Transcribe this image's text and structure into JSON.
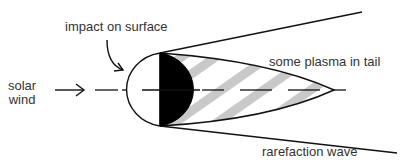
{
  "diagram": {
    "labels": {
      "impact": "impact on surface",
      "solar_wind": "solar\nwind",
      "plasma_tail": "some plasma in tail",
      "rarefaction": "rarefaction wave"
    },
    "colors": {
      "line": "#111111",
      "shadow_fill": "#000000",
      "stripe": "#c9c9c9",
      "text": "#333333",
      "background": "#ffffff"
    },
    "elements": [
      "solar wind arrow",
      "body (dayside white, nightside black)",
      "impact arrow",
      "plasma tail with gray stripes",
      "rarefaction wave boundary lines",
      "dashed symmetry axis"
    ]
  }
}
